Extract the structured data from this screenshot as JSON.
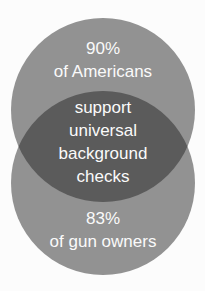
{
  "venn": {
    "colors": {
      "background": "#fcfcfc",
      "circle": "#929292",
      "overlap": "#5b5b5b",
      "text": "#fafafa"
    },
    "top_circle": {
      "stat": "90%",
      "label": "of Americans"
    },
    "overlap": {
      "lines": [
        "support",
        "universal",
        "background",
        "checks"
      ]
    },
    "bottom_circle": {
      "stat": "83%",
      "label": "of gun owners"
    }
  }
}
